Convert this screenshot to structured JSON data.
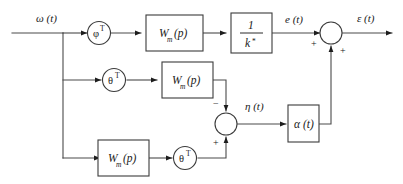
{
  "diagram": {
    "colors": {
      "line": "#4a4a4a",
      "block_stroke": "#3b3b3b",
      "text": "#1a1a1a",
      "background": "#ffffff"
    },
    "signals": {
      "input": "ω (t)",
      "branch1_out": "e (t)",
      "final_out": "ε (t)",
      "mid_sum_out": "η (t)"
    },
    "blocks": {
      "phi_gain": {
        "symbol": "φ",
        "superscript": "T"
      },
      "theta_gain_mid": {
        "symbol": "θ",
        "superscript": "T"
      },
      "theta_gain_bottom": {
        "symbol": "θ",
        "superscript": "T"
      },
      "wm_top": {
        "symbol": "W",
        "subscript": "m",
        "arg": "(p)"
      },
      "wm_mid": {
        "symbol": "W",
        "subscript": "m",
        "arg": "(p)"
      },
      "wm_bottom": {
        "symbol": "W",
        "subscript": "m",
        "arg": "(p)"
      },
      "inv_k": {
        "numerator": "1",
        "denominator": "k",
        "denominator_superscript": "*"
      },
      "alpha": {
        "label": "α (t)"
      }
    },
    "summers": {
      "output_sum": {
        "input_left_sign": "+",
        "input_bottom_sign": "+"
      },
      "eta_sum": {
        "input_top_sign": "−",
        "input_bottom_sign": "+"
      }
    }
  }
}
